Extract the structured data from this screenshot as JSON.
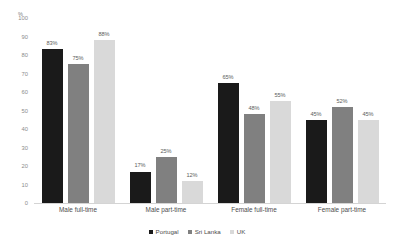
{
  "chart_data": {
    "type": "bar",
    "title": "",
    "xlabel": "",
    "ylabel": "%",
    "ylim": [
      0,
      100
    ],
    "grid": false,
    "legend_position": "bottom-center",
    "categories": [
      "Male full-time",
      "Male part-time",
      "Female full-time",
      "Female part-time"
    ],
    "series": [
      {
        "name": "Portugal",
        "color": "#1a1a1a",
        "values": [
          83,
          17,
          65,
          45
        ],
        "labels": [
          "83%",
          "17%",
          "65%",
          "45%"
        ]
      },
      {
        "name": "Sri Lanka",
        "color": "#808080",
        "values": [
          75,
          25,
          48,
          52
        ],
        "labels": [
          "75%",
          "25%",
          "48%",
          "52%"
        ]
      },
      {
        "name": "UK",
        "color": "#d9d9d9",
        "values": [
          88,
          12,
          55,
          45
        ],
        "labels": [
          "88%",
          "12%",
          "55%",
          "45%"
        ]
      }
    ],
    "y_ticks": [
      "100",
      "90",
      "80",
      "70",
      "60",
      "50",
      "40",
      "30",
      "20",
      "10",
      "0"
    ],
    "y_tick_values": [
      100,
      90,
      80,
      70,
      60,
      50,
      40,
      30,
      20,
      10,
      0
    ]
  }
}
